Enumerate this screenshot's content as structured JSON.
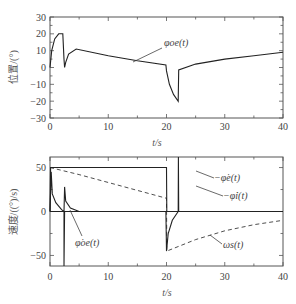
{
  "chart_data": [
    {
      "type": "line",
      "panel": "top",
      "title": "",
      "xlabel": "t/s",
      "ylabel": "位置/(°)",
      "xlim": [
        0,
        40
      ],
      "ylim": [
        -30,
        30
      ],
      "xticks": [
        "0",
        "10",
        "20",
        "30",
        "40"
      ],
      "yticks": [
        "30",
        "20",
        "10",
        "0",
        "−10",
        "−20",
        "−30"
      ],
      "grid": false,
      "series": [
        {
          "name": "φ_oe(t)",
          "style": "solid",
          "x": [
            0,
            0.3,
            0.8,
            1.5,
            2.2,
            2.4,
            2.5,
            2.7,
            3.2,
            4.5,
            10,
            15,
            19.9,
            20,
            20.5,
            21.2,
            22,
            22.1,
            25,
            30,
            35,
            40
          ],
          "y": [
            0,
            10,
            17,
            20,
            20,
            5,
            0,
            3,
            8,
            11,
            7,
            4,
            1.5,
            -2,
            -10,
            -16,
            -20,
            -1.5,
            2,
            5,
            7,
            9
          ]
        }
      ],
      "annotations": [
        {
          "text": "φ_oe(t)",
          "x": 22,
          "y": 14
        }
      ]
    },
    {
      "type": "line",
      "panel": "bottom",
      "title": "",
      "xlabel": "t/s",
      "ylabel": "速度/((°)/s)",
      "xlim": [
        0,
        40
      ],
      "ylim": [
        -62,
        62
      ],
      "xticks": [
        "0",
        "10",
        "20",
        "30",
        "40"
      ],
      "yticks": [
        "50",
        "0",
        "−50"
      ],
      "grid": false,
      "series": [
        {
          "name": "φ̇_e(t)",
          "style": "solid",
          "x": [
            0,
            0.1,
            20,
            20.05,
            22
          ],
          "y": [
            0,
            50,
            50,
            0,
            0
          ]
        },
        {
          "name": "φ̇_i(t)",
          "style": "solid",
          "x": [
            0,
            2.4,
            2.4,
            2.5,
            2.6,
            22,
            22.05,
            22.1,
            40
          ],
          "y": [
            0,
            0,
            -62,
            0,
            0,
            0,
            62,
            0,
            0
          ]
        },
        {
          "name": "φ̇_oe(t)",
          "style": "solid",
          "x": [
            0,
            0.2,
            0.4,
            1,
            2,
            2.4,
            2.5,
            2.7,
            3.5,
            5,
            19.9,
            20,
            20.3,
            21,
            22,
            40
          ],
          "y": [
            0,
            45,
            20,
            10,
            2,
            0,
            28,
            12,
            4,
            0,
            0,
            -45,
            -25,
            -10,
            0,
            0
          ]
        },
        {
          "name": "ω_s(t)",
          "style": "dashed",
          "x": [
            0,
            5,
            10,
            15,
            20,
            20.05,
            25,
            30,
            35,
            40
          ],
          "y": [
            50,
            42,
            33,
            24,
            15,
            -45,
            -32,
            -22,
            -15,
            -10
          ]
        }
      ],
      "annotations": [
        {
          "text": "φ̇_e(t)",
          "x": 30,
          "y": 33
        },
        {
          "text": "φ̇_i(t)",
          "x": 33,
          "y": 20
        },
        {
          "text": "φ̇_oe(t)",
          "x": 7,
          "y": -27
        },
        {
          "text": "ω_s(t)",
          "x": 33,
          "y": -30
        }
      ]
    }
  ],
  "labels": {
    "top_ylabel": "位置/(°)",
    "bottom_ylabel": "速度/((°)/s)",
    "top_xlabel": "t/s",
    "bottom_xlabel": "t/s",
    "ann_top_phi_oe": "φoe(t)",
    "ann_bot_phi_e": "−φ̇e(t)",
    "ann_bot_phi_i": "−φ̇i(t)",
    "ann_bot_phi_oe": "φ̇oe(t)",
    "ann_bot_omega_s": "ωs(t)"
  }
}
